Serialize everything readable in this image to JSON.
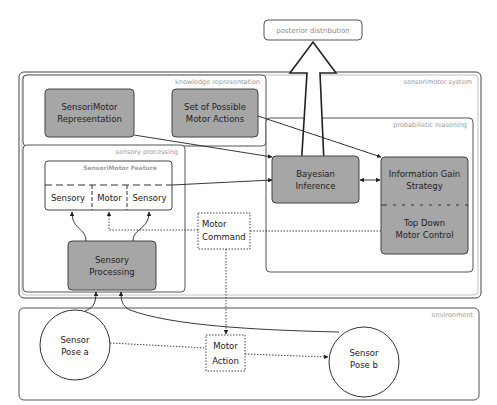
{
  "diagram": {
    "posterior": {
      "label": "posterior distribution"
    },
    "groups": {
      "sensorimotor_system": "sensorimotor system",
      "knowledge_representation": "knowledge representation",
      "probabilistic_reasoning": "probabilistic reasoning",
      "sensory_processing": "sensory processing",
      "environment": "environment"
    },
    "nodes": {
      "sensorimotor_representation": [
        "SensoriMotor",
        "Representation"
      ],
      "possible_motor_actions": [
        "Set of Possible",
        "Motor Actions"
      ],
      "bayesian_inference": [
        "Bayesian",
        "Inference"
      ],
      "information_gain": [
        "Information Gain",
        "Strategy"
      ],
      "top_down_control": [
        "Top Down",
        "Motor Control"
      ],
      "sensorimotor_feature": {
        "title": "SensoriMotor Feature",
        "cells": [
          "Sensory",
          "Motor",
          "Sensory"
        ]
      },
      "sensory_processing": [
        "Sensory",
        "Processing"
      ],
      "motor_command": [
        "Motor",
        "Command"
      ],
      "motor_action": [
        "Motor",
        "Action"
      ],
      "sensor_pose_a": [
        "Sensor",
        "Pose a"
      ],
      "sensor_pose_b": [
        "Sensor",
        "Pose b"
      ]
    },
    "colors": {
      "node_fill": "#a6a6a6",
      "node_stroke": "#444444",
      "group_stroke": "#555555",
      "group_label": "#9a9a9a",
      "text": "#222222"
    }
  }
}
